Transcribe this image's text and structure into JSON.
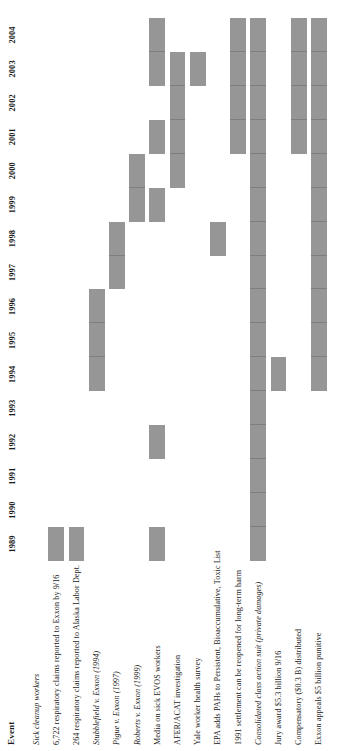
{
  "figure": {
    "kind": "gantt-timeline",
    "orientation": "rotated-90-ccw",
    "bar_color": "#969696",
    "background_color": "#ffffff",
    "text_color": "#1a1a1a"
  },
  "columns": {
    "event_header": "Event"
  },
  "chart_data": {
    "type": "bar",
    "subtype": "gantt",
    "title": "",
    "xlabel": "",
    "ylabel": "Event",
    "grid": false,
    "legend": null,
    "axis_ticks": [
      "1989",
      "1990",
      "1991",
      "1992",
      "1993",
      "1994",
      "1995",
      "1996",
      "1997",
      "1998",
      "1999",
      "2000",
      "2001",
      "2002",
      "2003",
      "2004"
    ],
    "xlim": [
      1989,
      2005
    ],
    "categories": [
      "Sick cleanup workers",
      "6,722 respiratory claims reported to Exxon by 9/16",
      "264 respiratory claims reported to Alaska Labor Dept.",
      "Stubblefield v. Exxon (1994)",
      "Pigue v. Exxon (1997)",
      "Roberts v. Exxon (1999)",
      "Media on sick EVOS workers",
      "AFER/ACAT investigation",
      "Yale worker health survey",
      "EPA adds PAHs to Persistent, Bioaccumulative, Toxic List",
      "1991 settlement can be reopened for long-term harm",
      "Consolidated class action suit (private damages)",
      "Jury award $5.3 billion 9/16",
      "Compensatory ($0.3 B) distributed",
      "Exxon appeals $5 billion punitive"
    ],
    "rows": [
      {
        "label": "Sick cleanup workers",
        "style": "italic-heading",
        "bars": []
      },
      {
        "label": "6,722 respiratory claims reported to Exxon by 9/16",
        "style": "normal",
        "bars": [
          {
            "start": 1989,
            "end": 1990
          }
        ]
      },
      {
        "label": "264 respiratory claims reported to Alaska Labor Dept.",
        "style": "normal",
        "bars": [
          {
            "start": 1989,
            "end": 1990
          }
        ]
      },
      {
        "label": "Stubblefield v. Exxon (1994)",
        "style": "italic",
        "bars": [
          {
            "start": 1994,
            "end": 1997
          }
        ]
      },
      {
        "label": "Pigue v. Exxon (1997)",
        "style": "italic",
        "bars": [
          {
            "start": 1997,
            "end": 1999
          }
        ]
      },
      {
        "label": "Roberts v. Exxon (1999)",
        "style": "italic",
        "bars": [
          {
            "start": 1999,
            "end": 2001
          }
        ]
      },
      {
        "label": "Media on sick EVOS workers",
        "style": "normal",
        "bars": [
          {
            "start": 1989,
            "end": 1990
          },
          {
            "start": 1992,
            "end": 1993
          },
          {
            "start": 1999,
            "end": 2000
          },
          {
            "start": 2001,
            "end": 2002
          },
          {
            "start": 2003,
            "end": 2005
          }
        ]
      },
      {
        "label": "AFER/ACAT investigation",
        "style": "normal",
        "bars": [
          {
            "start": 2000,
            "end": 2004
          }
        ]
      },
      {
        "label": "Yale worker health survey",
        "style": "normal",
        "bars": [
          {
            "start": 2003,
            "end": 2004
          }
        ]
      },
      {
        "label": "EPA adds PAHs to Persistent, Bioaccumulative, Toxic List",
        "style": "normal",
        "bars": [
          {
            "start": 1998,
            "end": 1999
          }
        ]
      },
      {
        "label": "1991 settlement can be reopened for long-term harm",
        "style": "normal",
        "bars": [
          {
            "start": 2001,
            "end": 2005
          }
        ]
      },
      {
        "label": "Consolidated class action suit (private damages)",
        "style": "italic",
        "bars": [
          {
            "start": 1989,
            "end": 2005
          }
        ]
      },
      {
        "label": "Jury award $5.3 billion 9/16",
        "style": "normal",
        "bars": [
          {
            "start": 1994,
            "end": 1995
          }
        ]
      },
      {
        "label": "Compensatory ($0.3 B) distributed",
        "style": "normal",
        "bars": [
          {
            "start": 2001,
            "end": 2005
          }
        ]
      },
      {
        "label": "Exxon appeals $5 billion punitive",
        "style": "normal",
        "bars": [
          {
            "start": 1994,
            "end": 2005
          }
        ]
      }
    ]
  }
}
